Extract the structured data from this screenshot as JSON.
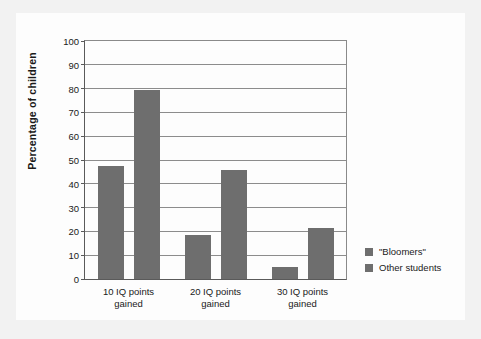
{
  "chart_data": {
    "type": "bar",
    "title": "",
    "xlabel": "",
    "ylabel": "Percentage of children",
    "categories": [
      "10 IQ points\ngained",
      "20 IQ points\ngained",
      "30 IQ points\ngained"
    ],
    "categories_lines": [
      [
        "10 IQ points",
        "gained"
      ],
      [
        "20 IQ points",
        "gained"
      ],
      [
        "30 IQ points",
        "gained"
      ]
    ],
    "series": [
      {
        "name": "\"Bloomers\"",
        "values": [
          47.5,
          18.5,
          5
        ]
      },
      {
        "name": "Other students",
        "values": [
          79.5,
          46,
          21.5
        ]
      }
    ],
    "ylim": [
      0,
      100
    ],
    "ytick_step": 10,
    "yticks": [
      0,
      10,
      20,
      30,
      40,
      50,
      60,
      70,
      80,
      90,
      100
    ],
    "ytick_labels": [
      "0",
      "10",
      "20",
      "30",
      "40",
      "50",
      "60",
      "70",
      "80",
      "90",
      "100"
    ],
    "grid": true,
    "legend_position": "right",
    "colors": {
      "bar": "#6e6e6e",
      "axis": "#5a5a5a",
      "grid": "#8c8c8c",
      "plot_background": "#fdfdfd",
      "card_background": "#fdfdfd",
      "page_background": "#f2f2f2",
      "text": "#1a1a1a"
    }
  },
  "legend": {
    "items": [
      {
        "label": "\"Bloomers\"",
        "color": "#6e6e6e"
      },
      {
        "label": "Other students",
        "color": "#6e6e6e"
      }
    ]
  }
}
